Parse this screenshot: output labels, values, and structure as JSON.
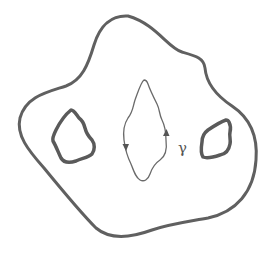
{
  "diagram": {
    "labels": {
      "curve": "γ"
    },
    "colors": {
      "boundary": "#606060",
      "curve": "#6a6a6a",
      "background": "#ffffff"
    },
    "elements": [
      {
        "name": "outer-boundary",
        "type": "closed-curve",
        "stroke_width": 3
      },
      {
        "name": "left-hole",
        "type": "closed-curve",
        "stroke_width": 3.5
      },
      {
        "name": "right-hole",
        "type": "closed-curve",
        "stroke_width": 3.5
      },
      {
        "name": "gamma-curve",
        "type": "oriented-closed-curve",
        "stroke_width": 1.3,
        "arrows": 2
      }
    ]
  }
}
